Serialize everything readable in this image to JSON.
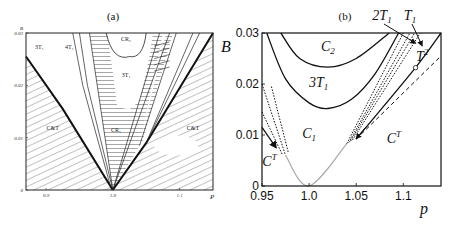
{
  "chart_data": [
    {
      "type": "line",
      "panel": "a",
      "title": "(a)",
      "xlabel": "P",
      "ylabel": "B",
      "xlim": [
        0.87,
        1.15
      ],
      "ylim": [
        0,
        0.03
      ],
      "xticks": [
        {
          "v": 0.9,
          "label": "0.9"
        },
        {
          "v": 1.0,
          "label": "1.0"
        },
        {
          "v": 1.1,
          "label": "1.1"
        }
      ],
      "yticks": [
        {
          "v": 0,
          "label": "0"
        },
        {
          "v": 0.01,
          "label": "0.01"
        },
        {
          "v": 0.02,
          "label": "0.02"
        },
        {
          "v": 0.03,
          "label": "0.03"
        }
      ],
      "regions": [
        {
          "label": "3T₁",
          "x": 0.89,
          "y": 0.027
        },
        {
          "label": "4T₁",
          "x": 0.935,
          "y": 0.027
        },
        {
          "label": "CR₂",
          "x": 1.02,
          "y": 0.0285
        },
        {
          "label": "3T₁",
          "x": 1.02,
          "y": 0.0215
        },
        {
          "label": "CR₁",
          "x": 1.005,
          "y": 0.011
        },
        {
          "label": "C&T",
          "x": 0.91,
          "y": 0.0115
        },
        {
          "label": "C&T",
          "x": 1.12,
          "y": 0.0115
        }
      ],
      "boundaries": [
        {
          "name": "left-V",
          "points": [
            [
              0.87,
              0.0255
            ],
            [
              0.925,
              0.0155
            ],
            [
              1.0,
              0.0
            ]
          ]
        },
        {
          "name": "right-V",
          "points": [
            [
              1.0,
              0.0
            ],
            [
              1.05,
              0.009
            ],
            [
              1.15,
              0.03
            ]
          ]
        },
        {
          "name": "CR2-curve",
          "points": [
            [
              0.99,
              0.03
            ],
            [
              1.01,
              0.0255
            ],
            [
              1.04,
              0.025
            ],
            [
              1.06,
              0.03
            ]
          ]
        },
        {
          "name": "3T1-curve",
          "points": [
            [
              0.96,
              0.03
            ],
            [
              0.975,
              0.02
            ],
            [
              1.0,
              0.0155
            ],
            [
              1.04,
              0.017
            ],
            [
              1.07,
              0.03
            ]
          ]
        }
      ],
      "curve_labels": [
        "f₂₇",
        "f₂₇",
        "f₅",
        "f₆",
        "f₁₉",
        "f₂₆",
        "f₂₅",
        "f₂₆",
        "f₂₇",
        "f₂₈"
      ]
    },
    {
      "type": "line",
      "panel": "b",
      "title": "(b)",
      "xlabel": "p",
      "ylabel": "B",
      "xlim": [
        0.95,
        1.14
      ],
      "ylim": [
        0,
        0.03
      ],
      "xticks": [
        {
          "v": 0.95,
          "label": "0.95"
        },
        {
          "v": 1.0,
          "label": "1.0"
        },
        {
          "v": 1.05,
          "label": "1.05"
        },
        {
          "v": 1.1,
          "label": "1.1"
        }
      ],
      "yticks": [
        {
          "v": 0,
          "label": "0"
        },
        {
          "v": 0.01,
          "label": "0.01"
        },
        {
          "v": 0.02,
          "label": "0.02"
        },
        {
          "v": 0.03,
          "label": "0.03"
        }
      ],
      "regions": [
        {
          "label": "C",
          "sub": "2",
          "sup": "",
          "x": 1.02,
          "y": 0.0265
        },
        {
          "label": "3T",
          "sub": "1",
          "sup": "",
          "x": 1.01,
          "y": 0.0195
        },
        {
          "label": "C",
          "sub": "1",
          "sup": "",
          "x": 1.0,
          "y": 0.0095
        },
        {
          "label": "C",
          "sub": "",
          "sup": "T",
          "x": 0.958,
          "y": 0.004
        },
        {
          "label": "C",
          "sub": "",
          "sup": "T",
          "x": 1.09,
          "y": 0.0085
        },
        {
          "label": "T",
          "sub": "",
          "sup": "2",
          "x": 1.12,
          "y": 0.0245
        }
      ],
      "annotations": [
        {
          "label": "2T",
          "sub": "1",
          "arrow_to": [
            1.113,
            0.028
          ]
        },
        {
          "label": "T",
          "sub": "1",
          "arrow_to": [
            1.12,
            0.0275
          ]
        }
      ],
      "series": [
        {
          "name": "C2-boundary",
          "style": "solid",
          "points": [
            [
              0.97,
              0.03
            ],
            [
              0.99,
              0.025
            ],
            [
              1.02,
              0.0233
            ],
            [
              1.05,
              0.025
            ],
            [
              1.085,
              0.03
            ]
          ]
        },
        {
          "name": "3T1-boundary",
          "style": "solid",
          "points": [
            [
              0.955,
              0.03
            ],
            [
              0.975,
              0.021
            ],
            [
              1.0,
              0.0163
            ],
            [
              1.02,
              0.0152
            ],
            [
              1.045,
              0.017
            ],
            [
              1.07,
              0.022
            ],
            [
              1.095,
              0.03
            ]
          ]
        },
        {
          "name": "gray-V",
          "style": "gray",
          "points": [
            [
              0.975,
              0.006
            ],
            [
              1.0,
              0.0
            ],
            [
              1.04,
              0.0083
            ]
          ]
        },
        {
          "name": "left-solid",
          "style": "solid",
          "points": [
            [
              0.95,
              0.0115
            ],
            [
              0.965,
              0.0075
            ]
          ]
        },
        {
          "name": "left-dot-1",
          "style": "dotted",
          "points": [
            [
              0.95,
              0.02
            ],
            [
              0.975,
              0.006
            ]
          ]
        },
        {
          "name": "left-dot-2",
          "style": "dotted",
          "points": [
            [
              0.95,
              0.0145
            ],
            [
              0.972,
              0.006
            ]
          ]
        },
        {
          "name": "left-dot-3",
          "style": "dotted",
          "points": [
            [
              0.96,
              0.0195
            ],
            [
              0.978,
              0.0065
            ]
          ]
        },
        {
          "name": "right-dot-1",
          "style": "dotted",
          "points": [
            [
              1.04,
              0.0083
            ],
            [
              1.1,
              0.03
            ]
          ]
        },
        {
          "name": "right-dot-2",
          "style": "dotted",
          "points": [
            [
              1.042,
              0.0085
            ],
            [
              1.107,
              0.03
            ]
          ]
        },
        {
          "name": "right-dot-3",
          "style": "dotted",
          "points": [
            [
              1.044,
              0.0088
            ],
            [
              1.112,
              0.03
            ]
          ]
        },
        {
          "name": "right-dot-4",
          "style": "dotted",
          "points": [
            [
              1.046,
              0.009
            ],
            [
              1.118,
              0.03
            ]
          ]
        },
        {
          "name": "T1-boundary",
          "style": "solid",
          "points": [
            [
              1.05,
              0.0092
            ],
            [
              1.113,
              0.0232
            ],
            [
              1.14,
              0.03
            ]
          ]
        },
        {
          "name": "T2-dashed",
          "style": "dashed",
          "points": [
            [
              1.05,
              0.0092
            ],
            [
              1.14,
              0.0255
            ]
          ]
        }
      ],
      "marker": {
        "x": 1.113,
        "y": 0.0232,
        "shape": "open-circle"
      }
    }
  ]
}
